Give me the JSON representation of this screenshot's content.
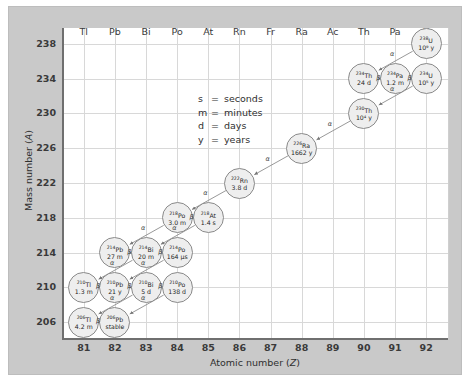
{
  "chart_data": {
    "type": "scatter",
    "xlabel": "Atomic number (Z)",
    "ylabel": "Mass number (A)",
    "xlim": [
      80.3,
      92.7
    ],
    "ylim": [
      204.2,
      239.8
    ],
    "xticks": [
      81,
      82,
      83,
      84,
      85,
      86,
      87,
      88,
      89,
      90,
      91,
      92
    ],
    "yticks": [
      206,
      210,
      214,
      218,
      222,
      226,
      230,
      234,
      238
    ],
    "grid": true,
    "element_symbols": [
      "Tl",
      "Pb",
      "Bi",
      "Po",
      "At",
      "Rn",
      "Fr",
      "Ra",
      "Ac",
      "Th",
      "Pa",
      "U"
    ],
    "legend_position": "center-left inside plot",
    "nuclides": [
      {
        "id": "U238",
        "mass": "238",
        "element": "U",
        "z": 92,
        "a": 238,
        "halflife": "10⁹ y"
      },
      {
        "id": "Th234",
        "mass": "234",
        "element": "Th",
        "z": 90,
        "a": 234,
        "halflife": "24 d"
      },
      {
        "id": "Pa234",
        "mass": "234",
        "element": "Pa",
        "z": 91,
        "a": 234,
        "halflife": "1.2 m"
      },
      {
        "id": "U234",
        "mass": "234",
        "element": "U",
        "z": 92,
        "a": 234,
        "halflife": "10⁵ y"
      },
      {
        "id": "Th230",
        "mass": "230",
        "element": "Th",
        "z": 90,
        "a": 230,
        "halflife": "10⁴ y"
      },
      {
        "id": "Ra226",
        "mass": "226",
        "element": "Ra",
        "z": 88,
        "a": 226,
        "halflife": "1662 y"
      },
      {
        "id": "Rn222",
        "mass": "222",
        "element": "Rn",
        "z": 86,
        "a": 222,
        "halflife": "3.8 d"
      },
      {
        "id": "Po218",
        "mass": "218",
        "element": "Po",
        "z": 84,
        "a": 218,
        "halflife": "3.0 m"
      },
      {
        "id": "At218",
        "mass": "218",
        "element": "At",
        "z": 85,
        "a": 218,
        "halflife": "1.4 s"
      },
      {
        "id": "Pb214",
        "mass": "214",
        "element": "Pb",
        "z": 82,
        "a": 214,
        "halflife": "27 m"
      },
      {
        "id": "Bi214",
        "mass": "214",
        "element": "Bi",
        "z": 83,
        "a": 214,
        "halflife": "20 m"
      },
      {
        "id": "Po214",
        "mass": "214",
        "element": "Po",
        "z": 84,
        "a": 214,
        "halflife": "164 µs"
      },
      {
        "id": "Tl210",
        "mass": "210",
        "element": "Tl",
        "z": 81,
        "a": 210,
        "halflife": "1.3 m"
      },
      {
        "id": "Pb210",
        "mass": "210",
        "element": "Pb",
        "z": 82,
        "a": 210,
        "halflife": "21 y"
      },
      {
        "id": "Bi210",
        "mass": "210",
        "element": "Bi",
        "z": 83,
        "a": 210,
        "halflife": "5 d"
      },
      {
        "id": "Po210",
        "mass": "210",
        "element": "Po",
        "z": 84,
        "a": 210,
        "halflife": "138 d"
      },
      {
        "id": "Tl206",
        "mass": "206",
        "element": "Tl",
        "z": 81,
        "a": 206,
        "halflife": "4.2 m"
      },
      {
        "id": "Pb206",
        "mass": "206",
        "element": "Pb",
        "z": 82,
        "a": 206,
        "halflife": "stable"
      }
    ],
    "decays": [
      {
        "from": "U238",
        "to": "Th234",
        "mode": "α"
      },
      {
        "from": "Th234",
        "to": "Pa234",
        "mode": "β"
      },
      {
        "from": "Pa234",
        "to": "U234",
        "mode": "β"
      },
      {
        "from": "U234",
        "to": "Th230",
        "mode": "α"
      },
      {
        "from": "Th230",
        "to": "Ra226",
        "mode": "α"
      },
      {
        "from": "Ra226",
        "to": "Rn222",
        "mode": "α"
      },
      {
        "from": "Rn222",
        "to": "Po218",
        "mode": "α"
      },
      {
        "from": "Po218",
        "to": "At218",
        "mode": "β"
      },
      {
        "from": "Po218",
        "to": "Pb214",
        "mode": "α"
      },
      {
        "from": "At218",
        "to": "Bi214",
        "mode": "α"
      },
      {
        "from": "Pb214",
        "to": "Bi214",
        "mode": "β"
      },
      {
        "from": "Bi214",
        "to": "Po214",
        "mode": "β"
      },
      {
        "from": "Bi214",
        "to": "Tl210",
        "mode": "α"
      },
      {
        "from": "Po214",
        "to": "Pb210",
        "mode": "α"
      },
      {
        "from": "Tl210",
        "to": "Pb210",
        "mode": "β"
      },
      {
        "from": "Pb210",
        "to": "Bi210",
        "mode": "β"
      },
      {
        "from": "Bi210",
        "to": "Po210",
        "mode": "β"
      },
      {
        "from": "Bi210",
        "to": "Tl206",
        "mode": "α"
      },
      {
        "from": "Po210",
        "to": "Pb206",
        "mode": "α"
      },
      {
        "from": "Tl206",
        "to": "Pb206",
        "mode": "β"
      }
    ]
  },
  "legend": {
    "rows": [
      {
        "symbol": "s",
        "eq": "=",
        "text": "seconds"
      },
      {
        "symbol": "m",
        "eq": "=",
        "text": "minutes"
      },
      {
        "symbol": "d",
        "eq": "=",
        "text": "days"
      },
      {
        "symbol": "y",
        "eq": "=",
        "text": "years"
      }
    ]
  },
  "axes": {
    "xlabel_prefix": "Atomic number (",
    "xlabel_var": "Z",
    "xlabel_suffix": ")",
    "ylabel_prefix": "Mass number (",
    "ylabel_var": "A",
    "ylabel_suffix": ")"
  },
  "colors": {
    "mat": "#c9c9c9",
    "canvas": "#ffffff",
    "grid": "#d8d8d8",
    "axis": "#6f6f6f",
    "node_fill": "#eeeeee",
    "node_stroke": "#8a8a8a",
    "text": "#1f1f1f"
  }
}
